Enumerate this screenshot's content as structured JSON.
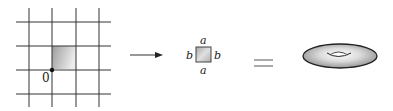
{
  "figure": {
    "grid": {
      "origin_label": "0",
      "vertical_lines_x": [
        29,
        52,
        76,
        99
      ],
      "horizontal_lines_y": [
        22,
        46,
        70,
        94
      ],
      "shaded_cell": {
        "x": 52,
        "y": 46,
        "w": 24,
        "h": 24
      }
    },
    "arrow": {
      "symbol": "→"
    },
    "square": {
      "top_label": "a",
      "bottom_label": "a",
      "left_label": "b",
      "right_label": "b"
    },
    "equals": {
      "symbol": "="
    },
    "torus": {
      "description": "torus"
    },
    "colors": {
      "line": "#333333",
      "shade_dark": "#9a9a9a",
      "shade_light": "#e6e6e6"
    }
  }
}
